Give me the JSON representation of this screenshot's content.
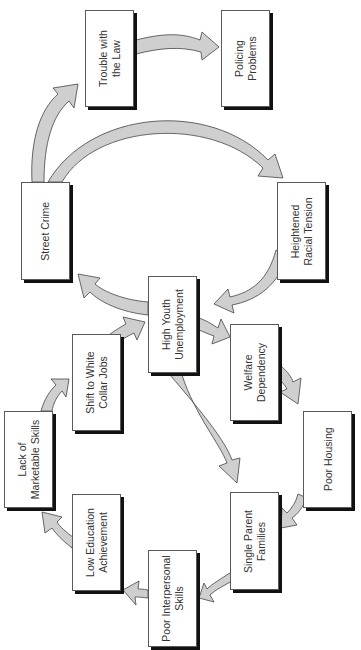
{
  "diagram": {
    "type": "cycle-flow",
    "orientation": "rotated-90-ccw",
    "colors": {
      "arrow_fill": "#cfcfcf",
      "arrow_stroke": "#444444",
      "box_border": "#5a5a5a",
      "box_shadow": "#111111",
      "text": "#333333"
    },
    "nodes": [
      {
        "id": "trouble",
        "label": "Trouble with\nthe Law",
        "x": 85,
        "y": 10,
        "w": 49,
        "h": 97
      },
      {
        "id": "policing",
        "label": "Policing\nProblems",
        "x": 221,
        "y": 10,
        "w": 49,
        "h": 97
      },
      {
        "id": "street",
        "label": "Street Crime",
        "x": 21,
        "y": 182,
        "w": 49,
        "h": 98
      },
      {
        "id": "racial",
        "label": "Heightened\nRacial Tension",
        "x": 277,
        "y": 182,
        "w": 49,
        "h": 98
      },
      {
        "id": "youth",
        "label": "High Youth\nUnemployment",
        "x": 148,
        "y": 276,
        "w": 49,
        "h": 97
      },
      {
        "id": "shift",
        "label": "Shift to White\nCollar Jobs",
        "x": 72,
        "y": 334,
        "w": 49,
        "h": 97
      },
      {
        "id": "welfare",
        "label": "Welfare\nDependency",
        "x": 230,
        "y": 324,
        "w": 49,
        "h": 97
      },
      {
        "id": "lack",
        "label": "Lack of\nMarketable Skills",
        "x": 4,
        "y": 411,
        "w": 49,
        "h": 97
      },
      {
        "id": "housing",
        "label": "Poor Housing",
        "x": 303,
        "y": 411,
        "w": 49,
        "h": 97
      },
      {
        "id": "education",
        "label": "Low Education\nAchievement",
        "x": 72,
        "y": 494,
        "w": 49,
        "h": 97
      },
      {
        "id": "single",
        "label": "Single Parent\nFamilies",
        "x": 230,
        "y": 492,
        "w": 49,
        "h": 98
      },
      {
        "id": "interpersonal",
        "label": "Poor Interpersonal\nSkills",
        "x": 148,
        "y": 550,
        "w": 49,
        "h": 97
      }
    ],
    "edges": [
      {
        "from": "street",
        "to": "trouble"
      },
      {
        "from": "trouble",
        "to": "policing"
      },
      {
        "from": "street",
        "to": "racial"
      },
      {
        "from": "racial",
        "to": "youth"
      },
      {
        "from": "youth",
        "to": "street"
      },
      {
        "from": "youth",
        "to": "welfare"
      },
      {
        "from": "welfare",
        "to": "housing"
      },
      {
        "from": "housing",
        "to": "single"
      },
      {
        "from": "youth",
        "to": "single"
      },
      {
        "from": "single",
        "to": "interpersonal"
      },
      {
        "from": "interpersonal",
        "to": "education"
      },
      {
        "from": "education",
        "to": "lack"
      },
      {
        "from": "lack",
        "to": "shift"
      },
      {
        "from": "shift",
        "to": "youth"
      }
    ]
  }
}
